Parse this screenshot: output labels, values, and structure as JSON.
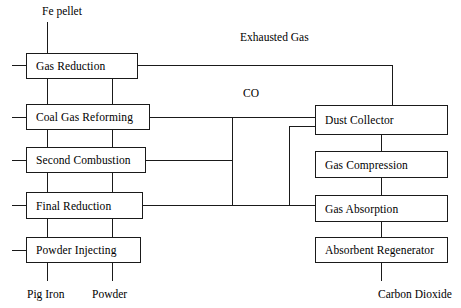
{
  "diagram": {
    "canvas": {
      "width": 461,
      "height": 308
    },
    "stroke_color": "#1a1a1a",
    "background_color": "#ffffff",
    "nodes": [
      {
        "id": "gas-reduction",
        "label": "Gas Reduction",
        "x": 26,
        "y": 53,
        "w": 112,
        "h": 26
      },
      {
        "id": "coal-gas-reforming",
        "label": "Coal Gas Reforming",
        "x": 26,
        "y": 104,
        "w": 124,
        "h": 26
      },
      {
        "id": "second-combustion",
        "label": "Second Combustion",
        "x": 26,
        "y": 147,
        "w": 120,
        "h": 26
      },
      {
        "id": "final-reduction",
        "label": "Final Reduction",
        "x": 26,
        "y": 192,
        "w": 117,
        "h": 27
      },
      {
        "id": "powder-injecting",
        "label": "Powder Injecting",
        "x": 26,
        "y": 237,
        "w": 115,
        "h": 26
      },
      {
        "id": "dust-collector",
        "label": "Dust Collector",
        "x": 315,
        "y": 105,
        "w": 133,
        "h": 30
      },
      {
        "id": "gas-compression",
        "label": "Gas Compression",
        "x": 315,
        "y": 151,
        "w": 133,
        "h": 27
      },
      {
        "id": "gas-absorption",
        "label": "Gas Absorption",
        "x": 315,
        "y": 195,
        "w": 133,
        "h": 27
      },
      {
        "id": "absorbent-regenerator",
        "label": "Absorbent Regenerator",
        "x": 315,
        "y": 237,
        "w": 133,
        "h": 26
      }
    ],
    "stream_labels": [
      {
        "id": "fe-pellet",
        "text": "Fe pellet",
        "x": 42,
        "y": 5
      },
      {
        "id": "exhausted-gas",
        "text": "Exhausted Gas",
        "x": 240,
        "y": 31
      },
      {
        "id": "co",
        "text": "CO",
        "x": 243,
        "y": 87
      },
      {
        "id": "pig-iron",
        "text": "Pig Iron",
        "x": 27,
        "y": 288
      },
      {
        "id": "powder",
        "text": "Powder",
        "x": 92,
        "y": 288
      },
      {
        "id": "carbon-dioxide",
        "text": "Carbon Dioxide",
        "x": 378,
        "y": 288
      }
    ],
    "edges": [
      {
        "id": "fe-pellet-feed",
        "orient": "v",
        "x": 47,
        "y": 22,
        "len": 31
      },
      {
        "id": "feed-stub-gas-reduction",
        "orient": "h",
        "x": 12,
        "y": 65,
        "len": 14
      },
      {
        "id": "feed-stub-coal-gas-reforming",
        "orient": "h",
        "x": 12,
        "y": 117,
        "len": 14
      },
      {
        "id": "feed-stub-second-combustion",
        "orient": "h",
        "x": 12,
        "y": 160,
        "len": 14
      },
      {
        "id": "feed-stub-final-reduction",
        "orient": "h",
        "x": 12,
        "y": 205,
        "len": 14
      },
      {
        "id": "feed-stub-powder-injecting",
        "orient": "h",
        "x": 12,
        "y": 250,
        "len": 14
      },
      {
        "id": "gas-reduction-to-coal-gas-reforming",
        "orient": "v",
        "x": 47,
        "y": 79,
        "len": 25
      },
      {
        "id": "coal-gas-reforming-to-second-combustion",
        "orient": "v",
        "x": 47,
        "y": 130,
        "len": 17
      },
      {
        "id": "second-combustion-to-final-reduction",
        "orient": "v",
        "x": 47,
        "y": 173,
        "len": 19
      },
      {
        "id": "final-reduction-to-powder-injecting",
        "orient": "v",
        "x": 47,
        "y": 219,
        "len": 18
      },
      {
        "id": "pig-iron-outlet",
        "orient": "v",
        "x": 47,
        "y": 263,
        "len": 18
      },
      {
        "id": "powder-outlet",
        "orient": "v",
        "x": 112,
        "y": 263,
        "len": 18
      },
      {
        "id": "powder-injecting-to-final-reduction",
        "orient": "v",
        "x": 112,
        "y": 219,
        "len": 18
      },
      {
        "id": "final-reduction-to-second-combustion",
        "orient": "v",
        "x": 112,
        "y": 173,
        "len": 19
      },
      {
        "id": "second-combustion-to-coal-gas-reforming",
        "orient": "v",
        "x": 112,
        "y": 130,
        "len": 17
      },
      {
        "id": "coal-gas-reforming-to-gas-reduction",
        "orient": "v",
        "x": 112,
        "y": 79,
        "len": 25
      },
      {
        "id": "gas-reduction-outlet-right",
        "orient": "h",
        "x": 138,
        "y": 65,
        "len": 254
      },
      {
        "id": "exhausted-gas-riser",
        "orient": "v",
        "x": 392,
        "y": 65,
        "len": 40
      },
      {
        "id": "coal-gas-reforming-to-dust-collector",
        "orient": "h",
        "x": 150,
        "y": 117,
        "len": 165
      },
      {
        "id": "co-header-vertical",
        "orient": "v",
        "x": 232,
        "y": 117,
        "len": 88
      },
      {
        "id": "second-combustion-to-header",
        "orient": "h",
        "x": 146,
        "y": 160,
        "len": 86
      },
      {
        "id": "final-reduction-to-gas-absorption",
        "orient": "h",
        "x": 143,
        "y": 205,
        "len": 172
      },
      {
        "id": "dust-collector-to-gas-compression",
        "orient": "v",
        "x": 381,
        "y": 135,
        "len": 16
      },
      {
        "id": "gas-compression-to-gas-absorption",
        "orient": "v",
        "x": 381,
        "y": 178,
        "len": 17
      },
      {
        "id": "gas-absorption-to-absorbent-regenerator",
        "orient": "v",
        "x": 381,
        "y": 222,
        "len": 15
      },
      {
        "id": "carbon-dioxide-outlet",
        "orient": "v",
        "x": 381,
        "y": 263,
        "len": 18
      },
      {
        "id": "dust-collector-return-horizontal",
        "orient": "h",
        "x": 289,
        "y": 126,
        "len": 26
      },
      {
        "id": "dust-collector-return-vertical",
        "orient": "v",
        "x": 289,
        "y": 126,
        "len": 79
      }
    ]
  }
}
